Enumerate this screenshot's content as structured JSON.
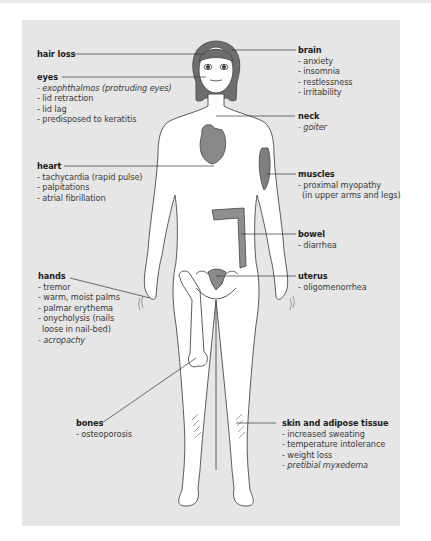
{
  "diagram": {
    "colors": {
      "background": "#e6e6e6",
      "body_fill": "#ffffff",
      "organ_fill": "#8a8a8a",
      "line": "#444444"
    },
    "labels": [
      {
        "id": "hair-loss",
        "title": "hair loss",
        "items": []
      },
      {
        "id": "eyes",
        "title": "eyes",
        "items": [
          {
            "text": "- exophthalmos (protruding eyes)",
            "italic": true
          },
          {
            "text": "- lid retraction",
            "italic": false
          },
          {
            "text": "- lid lag",
            "italic": false
          },
          {
            "text": "- predisposed to keratitis",
            "italic": false
          }
        ]
      },
      {
        "id": "brain",
        "title": "brain",
        "items": [
          {
            "text": "- anxiety",
            "italic": false
          },
          {
            "text": "- insomnia",
            "italic": false
          },
          {
            "text": "- restlessness",
            "italic": false
          },
          {
            "text": "- irritability",
            "italic": false
          }
        ]
      },
      {
        "id": "neck",
        "title": "neck",
        "items": [
          {
            "text": "- goiter",
            "italic": true
          }
        ]
      },
      {
        "id": "heart",
        "title": "heart",
        "items": [
          {
            "text": "- tachycardia (rapid pulse)",
            "italic": false
          },
          {
            "text": "- palpitations",
            "italic": false
          },
          {
            "text": "- atrial fibrillation",
            "italic": false
          }
        ]
      },
      {
        "id": "muscles",
        "title": "muscles",
        "items": [
          {
            "text": "- proximal myopathy",
            "italic": false
          },
          {
            "text": "  (in upper arms and legs)",
            "italic": false
          }
        ]
      },
      {
        "id": "bowel",
        "title": "bowel",
        "items": [
          {
            "text": "- diarrhea",
            "italic": false
          }
        ]
      },
      {
        "id": "uterus",
        "title": "uterus",
        "items": [
          {
            "text": "- oligomenorrhea",
            "italic": false
          }
        ]
      },
      {
        "id": "hands",
        "title": "hands",
        "items": [
          {
            "text": "- tremor",
            "italic": false
          },
          {
            "text": "- warm, moist palms",
            "italic": false
          },
          {
            "text": "- palmar erythema",
            "italic": false
          },
          {
            "text": "- onycholysis (nails",
            "italic": false
          },
          {
            "text": "  loose in nail-bed)",
            "italic": false
          },
          {
            "text": "- acropachy",
            "italic": true
          }
        ]
      },
      {
        "id": "bones",
        "title": "bones",
        "items": [
          {
            "text": "- osteoporosis",
            "italic": false
          }
        ]
      },
      {
        "id": "skin",
        "title": "skin and adipose tissue",
        "items": [
          {
            "text": "- increased sweating",
            "italic": false
          },
          {
            "text": "- temperature intolerance",
            "italic": false
          },
          {
            "text": "- weight loss",
            "italic": false
          },
          {
            "text": "- pretibial myxedema",
            "italic": true
          }
        ]
      }
    ]
  }
}
